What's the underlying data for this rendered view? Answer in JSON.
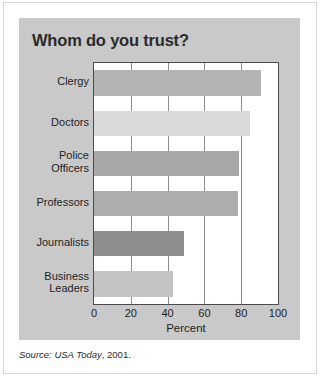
{
  "figure": {
    "title": "Whom do you trust?",
    "source_prefix": "Source:",
    "source_publication": "USA Today",
    "source_year": ", 2001."
  },
  "chart_data": {
    "type": "bar",
    "orientation": "horizontal",
    "title": "Whom do you trust?",
    "xlabel": "Percent",
    "ylabel": "",
    "xlim": [
      0,
      100
    ],
    "xticks": [
      0,
      20,
      40,
      60,
      80,
      100
    ],
    "xticklabels": [
      "0",
      "20",
      "40",
      "60",
      "80",
      "100"
    ],
    "grid": "vertical",
    "legend": "none",
    "categories": [
      "Clergy",
      "Doctors",
      "Police\nOfficers",
      "Professors",
      "Journalists",
      "Business\nLeaders"
    ],
    "values": [
      91,
      85,
      79,
      78,
      49,
      43
    ],
    "bar_colors": [
      "#b3b3b3",
      "#d9d9d9",
      "#a8a8a8",
      "#adadad",
      "#8e8e8e",
      "#c4c4c4"
    ],
    "panel_background": "#c9c9c9",
    "plot_background": "#ffffff",
    "axis_color": "#4a4a4a",
    "gridline_color": "#8d8d8d"
  }
}
